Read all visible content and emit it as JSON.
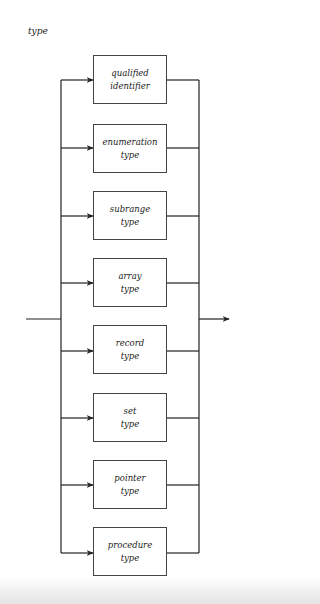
{
  "title": "type",
  "diagram": {
    "type": "syntax-diagram",
    "alternatives": [
      {
        "line1": "qualified",
        "line2": "identifier"
      },
      {
        "line1": "enumeration",
        "line2": "type"
      },
      {
        "line1": "subrange",
        "line2": "type"
      },
      {
        "line1": "array",
        "line2": "type"
      },
      {
        "line1": "record",
        "line2": "type"
      },
      {
        "line1": "set",
        "line2": "type"
      },
      {
        "line1": "pointer",
        "line2": "type"
      },
      {
        "line1": "procedure",
        "line2": "type"
      }
    ]
  }
}
